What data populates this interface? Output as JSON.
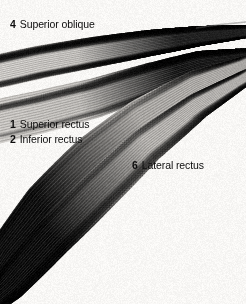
{
  "figure": {
    "kind": "anatomical-photograph",
    "background_color": "#f8f7f5",
    "text_color": "#0d0d0d",
    "width": 246,
    "height": 304
  },
  "labels": [
    {
      "key": "superior-oblique",
      "number": "4",
      "text": "Superior oblique",
      "x": 10,
      "y": 18
    },
    {
      "key": "superior-rectus",
      "number": "1",
      "text": "Superior rectus",
      "x": 10,
      "y": 118
    },
    {
      "key": "inferior-rectus",
      "number": "2",
      "text": "Inferior rectus",
      "x": 10,
      "y": 133
    },
    {
      "key": "lateral-rectus",
      "number": "6",
      "text": "Lateral rectus",
      "x": 132,
      "y": 159
    }
  ],
  "muscle_bands": [
    {
      "name": "superior-oblique-band",
      "label_ref": "4",
      "tone_light": "#d8d5d1",
      "tone_dark": "#1a1a1a",
      "description": "uppermost band, runs left-to-right slightly rising, darkest at right convergence"
    },
    {
      "name": "superior-rectus-band",
      "label_ref": "1",
      "tone_light": "#cfccc8",
      "tone_dark": "#141414",
      "description": "second band, broad at left, tapers toward right apex"
    },
    {
      "name": "lateral-rectus-band",
      "label_ref": "6",
      "tone_light": "#b9b6b2",
      "tone_dark": "#101010",
      "description": "band sweeping from right apex down toward lower left"
    },
    {
      "name": "inferior-rectus-band",
      "label_ref": "2",
      "tone_light": "#c4c1bd",
      "tone_dark": "#0e0e0e",
      "description": "lowest band, curves out through bottom-left corner"
    }
  ]
}
